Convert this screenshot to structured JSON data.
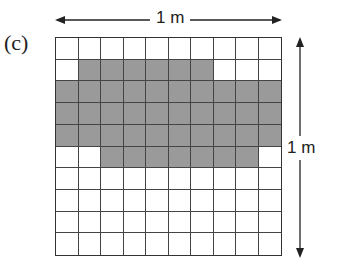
{
  "figure": {
    "part_label": "(c)",
    "width_label": "1 m",
    "height_label": "1 m",
    "grid": {
      "rows": 10,
      "cols": 10,
      "shaded_cells": {
        "0": [],
        "1": [
          1,
          2,
          3,
          4,
          5,
          6
        ],
        "2": [
          0,
          1,
          2,
          3,
          4,
          5,
          6,
          7,
          8,
          9
        ],
        "3": [
          0,
          1,
          2,
          3,
          4,
          5,
          6,
          7,
          8,
          9
        ],
        "4": [
          0,
          1,
          2,
          3,
          4,
          5,
          6,
          7,
          8,
          9
        ],
        "5": [
          2,
          3,
          4,
          5,
          6,
          7,
          8
        ],
        "6": [],
        "7": [],
        "8": [],
        "9": []
      },
      "shaded_count": 43,
      "shade_color": "#9a9a9a"
    }
  }
}
